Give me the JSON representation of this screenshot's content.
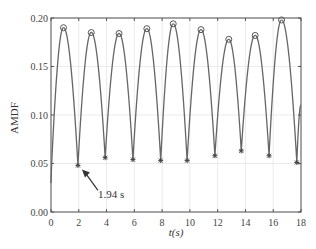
{
  "chart_data": {
    "type": "line",
    "title": "",
    "xlabel": "t(s)",
    "ylabel": "AMDF",
    "xlim": [
      0,
      18
    ],
    "ylim": [
      0,
      0.2
    ],
    "x_ticks": [
      "0",
      "2",
      "4",
      "6",
      "8",
      "10",
      "12",
      "14",
      "16",
      "18"
    ],
    "y_ticks": [
      "0.00",
      "0.05",
      "0.10",
      "0.15",
      "0.20"
    ],
    "grid": true,
    "legend": null,
    "series": [
      {
        "name": "AMDF",
        "x": [
          0,
          0.05,
          0.9,
          1.94,
          2.9,
          3.9,
          4.9,
          5.9,
          6.9,
          7.9,
          8.8,
          9.8,
          10.8,
          11.8,
          12.8,
          13.7,
          14.7,
          15.7,
          16.6,
          17.7,
          18
        ],
        "y": [
          0.03,
          0.05,
          0.19,
          0.048,
          0.185,
          0.056,
          0.184,
          0.054,
          0.189,
          0.053,
          0.194,
          0.053,
          0.188,
          0.058,
          0.178,
          0.063,
          0.182,
          0.058,
          0.198,
          0.051,
          0.11
        ]
      }
    ],
    "peaks": {
      "x": [
        0.9,
        2.9,
        4.9,
        6.9,
        8.8,
        10.8,
        12.8,
        14.7,
        16.6
      ],
      "y": [
        0.19,
        0.185,
        0.184,
        0.189,
        0.194,
        0.188,
        0.178,
        0.182,
        0.198
      ],
      "marker": "circle"
    },
    "troughs": {
      "x": [
        1.94,
        3.9,
        5.9,
        7.9,
        9.8,
        11.8,
        13.7,
        15.7,
        17.7
      ],
      "y": [
        0.048,
        0.056,
        0.054,
        0.053,
        0.053,
        0.058,
        0.063,
        0.058,
        0.051
      ],
      "marker": "asterisk"
    },
    "annotations": [
      {
        "text": "1.94 s",
        "x": 1.94,
        "y": 0.048,
        "arrow": true
      }
    ]
  }
}
